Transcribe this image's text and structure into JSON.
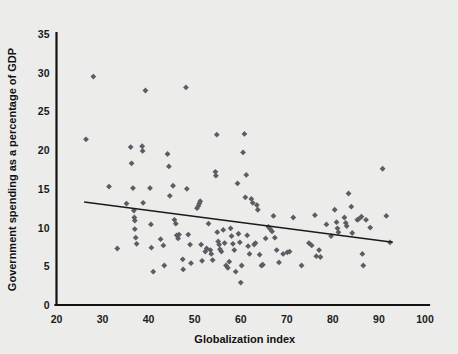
{
  "chart_data": {
    "type": "scatter",
    "title": "",
    "xlabel": "Globalization index",
    "ylabel": "Government spending as a percentage of GDP",
    "xlim": [
      20,
      100
    ],
    "ylim": [
      0,
      35
    ],
    "xticks": [
      20,
      30,
      40,
      50,
      60,
      70,
      80,
      90,
      100
    ],
    "yticks": [
      0,
      5,
      10,
      15,
      20,
      25,
      30,
      35
    ],
    "grid": false,
    "legend": null,
    "marker_shape": "diamond",
    "marker_color": "#5c5c64",
    "background_color": "#ececeb",
    "axis_color": "#121212",
    "trend_line": {
      "type": "linear-fit",
      "color": "#1b1b1b",
      "x_start": 26.0,
      "y_start": 13.3,
      "x_end": 93.0,
      "y_end": 8.1
    },
    "points": [
      [
        26.4,
        21.4
      ],
      [
        28.0,
        29.5
      ],
      [
        31.4,
        15.3
      ],
      [
        33.2,
        7.3
      ],
      [
        35.2,
        13.1
      ],
      [
        36.1,
        20.4
      ],
      [
        36.3,
        18.3
      ],
      [
        36.6,
        15.1
      ],
      [
        36.8,
        12.2
      ],
      [
        36.9,
        11.3
      ],
      [
        37.0,
        10.9
      ],
      [
        37.0,
        9.8
      ],
      [
        37.2,
        8.7
      ],
      [
        37.4,
        7.9
      ],
      [
        38.6,
        20.5
      ],
      [
        38.7,
        19.9
      ],
      [
        38.8,
        13.2
      ],
      [
        39.3,
        27.7
      ],
      [
        40.3,
        15.1
      ],
      [
        40.5,
        10.4
      ],
      [
        40.6,
        7.4
      ],
      [
        41.0,
        4.3
      ],
      [
        42.6,
        8.5
      ],
      [
        43.2,
        7.7
      ],
      [
        43.4,
        5.1
      ],
      [
        44.1,
        19.5
      ],
      [
        44.4,
        17.9
      ],
      [
        44.6,
        14.1
      ],
      [
        45.3,
        15.4
      ],
      [
        45.6,
        11.0
      ],
      [
        45.9,
        10.5
      ],
      [
        46.1,
        9.0
      ],
      [
        46.4,
        8.6
      ],
      [
        46.6,
        9.1
      ],
      [
        47.4,
        5.9
      ],
      [
        47.5,
        4.6
      ],
      [
        48.1,
        28.1
      ],
      [
        48.3,
        15.0
      ],
      [
        48.6,
        9.1
      ],
      [
        49.0,
        7.8
      ],
      [
        49.2,
        5.4
      ],
      [
        50.5,
        12.5
      ],
      [
        50.8,
        12.8
      ],
      [
        51.0,
        13.1
      ],
      [
        51.2,
        13.4
      ],
      [
        51.4,
        7.8
      ],
      [
        51.6,
        5.7
      ],
      [
        52.3,
        6.9
      ],
      [
        52.6,
        7.3
      ],
      [
        53.0,
        10.5
      ],
      [
        53.4,
        7.1
      ],
      [
        53.6,
        6.6
      ],
      [
        53.9,
        5.8
      ],
      [
        54.5,
        17.2
      ],
      [
        54.6,
        16.7
      ],
      [
        54.8,
        22.0
      ],
      [
        54.9,
        9.4
      ],
      [
        55.1,
        8.2
      ],
      [
        55.3,
        7.8
      ],
      [
        55.5,
        7.2
      ],
      [
        55.8,
        6.9
      ],
      [
        56.2,
        9.7
      ],
      [
        56.5,
        8.0
      ],
      [
        56.8,
        5.1
      ],
      [
        57.2,
        4.8
      ],
      [
        57.5,
        5.6
      ],
      [
        57.8,
        9.9
      ],
      [
        58.0,
        8.9
      ],
      [
        58.3,
        7.9
      ],
      [
        58.6,
        7.1
      ],
      [
        58.9,
        4.3
      ],
      [
        59.3,
        15.7
      ],
      [
        59.5,
        9.2
      ],
      [
        59.8,
        8.1
      ],
      [
        60.0,
        2.9
      ],
      [
        60.2,
        5.1
      ],
      [
        60.5,
        19.7
      ],
      [
        60.8,
        22.1
      ],
      [
        61.0,
        13.9
      ],
      [
        61.2,
        16.8
      ],
      [
        61.4,
        9.0
      ],
      [
        61.6,
        7.6
      ],
      [
        61.9,
        6.6
      ],
      [
        62.3,
        13.7
      ],
      [
        62.6,
        13.2
      ],
      [
        62.9,
        7.8
      ],
      [
        63.2,
        8.0
      ],
      [
        63.5,
        12.9
      ],
      [
        63.7,
        12.3
      ],
      [
        64.1,
        6.5
      ],
      [
        64.5,
        5.1
      ],
      [
        64.8,
        5.2
      ],
      [
        65.4,
        8.6
      ],
      [
        66.0,
        10.1
      ],
      [
        66.4,
        9.8
      ],
      [
        66.8,
        9.5
      ],
      [
        67.1,
        11.5
      ],
      [
        67.4,
        8.7
      ],
      [
        67.8,
        7.1
      ],
      [
        68.3,
        5.5
      ],
      [
        69.2,
        6.6
      ],
      [
        70.1,
        6.8
      ],
      [
        70.6,
        6.9
      ],
      [
        71.4,
        11.3
      ],
      [
        73.2,
        5.1
      ],
      [
        74.8,
        8.0
      ],
      [
        75.4,
        7.7
      ],
      [
        76.1,
        11.6
      ],
      [
        76.4,
        6.3
      ],
      [
        77.0,
        7.1
      ],
      [
        77.3,
        6.2
      ],
      [
        78.6,
        10.4
      ],
      [
        79.6,
        8.9
      ],
      [
        80.4,
        12.3
      ],
      [
        80.8,
        10.7
      ],
      [
        81.0,
        9.9
      ],
      [
        81.2,
        9.4
      ],
      [
        82.5,
        11.3
      ],
      [
        82.8,
        10.6
      ],
      [
        83.0,
        10.2
      ],
      [
        83.4,
        14.4
      ],
      [
        84.0,
        12.7
      ],
      [
        84.2,
        9.3
      ],
      [
        85.3,
        11.0
      ],
      [
        85.6,
        11.1
      ],
      [
        86.2,
        11.4
      ],
      [
        86.4,
        6.6
      ],
      [
        86.6,
        5.1
      ],
      [
        87.2,
        11.0
      ],
      [
        88.1,
        10.0
      ],
      [
        90.8,
        17.6
      ],
      [
        91.6,
        11.5
      ],
      [
        92.4,
        8.1
      ]
    ]
  }
}
